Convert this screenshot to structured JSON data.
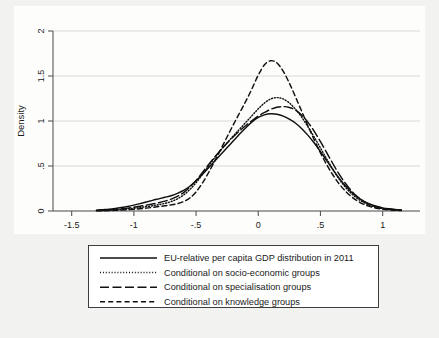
{
  "chart_data": {
    "type": "line",
    "title": "",
    "subtitle": "",
    "xlabel": "",
    "ylabel": "Density",
    "xlim": [
      -1.65,
      1.3
    ],
    "ylim": [
      0,
      2.12
    ],
    "grid": true,
    "grid_axis": "y",
    "legend_position": "below-plot",
    "xticks": [
      "-1.5",
      "-1",
      "-.5",
      "0",
      ".5",
      "1"
    ],
    "xtick_values": [
      -1.5,
      -1,
      -0.5,
      0,
      0.5,
      1
    ],
    "yticks": [
      "0",
      ".5",
      "1",
      "1.5",
      "2"
    ],
    "ytick_values": [
      0,
      0.5,
      1,
      1.5,
      2
    ],
    "x": [
      -1.3,
      -1.25,
      -1.2,
      -1.15,
      -1.1,
      -1.05,
      -1.0,
      -0.95,
      -0.9,
      -0.85,
      -0.8,
      -0.75,
      -0.7,
      -0.65,
      -0.6,
      -0.55,
      -0.5,
      -0.45,
      -0.4,
      -0.35,
      -0.3,
      -0.25,
      -0.2,
      -0.15,
      -0.1,
      -0.05,
      0.0,
      0.05,
      0.1,
      0.15,
      0.2,
      0.25,
      0.3,
      0.35,
      0.4,
      0.45,
      0.5,
      0.55,
      0.6,
      0.65,
      0.7,
      0.75,
      0.8,
      0.85,
      0.9,
      0.95,
      1.0,
      1.05,
      1.1,
      1.15
    ],
    "series": [
      {
        "name": "EU-relative per capita GDP distribution in 2011",
        "style": "solid",
        "peak_x": 0.04,
        "peak_y": 1.08,
        "values": [
          0.01,
          0.015,
          0.02,
          0.028,
          0.038,
          0.05,
          0.065,
          0.082,
          0.1,
          0.118,
          0.135,
          0.152,
          0.17,
          0.195,
          0.228,
          0.275,
          0.335,
          0.405,
          0.48,
          0.555,
          0.63,
          0.705,
          0.78,
          0.855,
          0.925,
          0.99,
          1.04,
          1.068,
          1.08,
          1.075,
          1.055,
          1.02,
          0.975,
          0.915,
          0.84,
          0.755,
          0.66,
          0.56,
          0.46,
          0.365,
          0.28,
          0.208,
          0.152,
          0.108,
          0.075,
          0.052,
          0.035,
          0.024,
          0.016,
          0.01
        ]
      },
      {
        "name": "Conditional on socio-economic groups",
        "style": "dotted",
        "peak_x": 0.06,
        "peak_y": 1.26,
        "values": [
          0.004,
          0.006,
          0.009,
          0.013,
          0.018,
          0.024,
          0.031,
          0.039,
          0.048,
          0.058,
          0.07,
          0.085,
          0.105,
          0.135,
          0.178,
          0.238,
          0.315,
          0.405,
          0.5,
          0.592,
          0.678,
          0.758,
          0.835,
          0.91,
          0.985,
          1.06,
          1.135,
          1.2,
          1.245,
          1.26,
          1.245,
          1.2,
          1.13,
          1.04,
          0.935,
          0.82,
          0.7,
          0.578,
          0.462,
          0.355,
          0.265,
          0.192,
          0.135,
          0.093,
          0.062,
          0.041,
          0.027,
          0.018,
          0.012,
          0.008
        ]
      },
      {
        "name": "Conditional on specialisation groups",
        "style": "longdash",
        "peak_x": 0.04,
        "peak_y": 1.16,
        "values": [
          0.006,
          0.009,
          0.013,
          0.018,
          0.024,
          0.032,
          0.042,
          0.053,
          0.065,
          0.078,
          0.092,
          0.11,
          0.132,
          0.162,
          0.205,
          0.265,
          0.34,
          0.425,
          0.515,
          0.6,
          0.68,
          0.755,
          0.825,
          0.89,
          0.95,
          1.005,
          1.055,
          1.095,
          1.13,
          1.152,
          1.16,
          1.15,
          1.12,
          1.065,
          0.985,
          0.885,
          0.77,
          0.648,
          0.525,
          0.41,
          0.308,
          0.222,
          0.155,
          0.105,
          0.069,
          0.045,
          0.029,
          0.019,
          0.012,
          0.008
        ]
      },
      {
        "name": "Conditional on knowledge groups",
        "style": "dash",
        "peak_x": 0.02,
        "peak_y": 1.67,
        "values": [
          0.002,
          0.003,
          0.005,
          0.007,
          0.01,
          0.014,
          0.019,
          0.025,
          0.032,
          0.04,
          0.049,
          0.058,
          0.068,
          0.082,
          0.105,
          0.145,
          0.212,
          0.308,
          0.425,
          0.555,
          0.69,
          0.825,
          0.96,
          1.09,
          1.22,
          1.36,
          1.51,
          1.625,
          1.67,
          1.645,
          1.555,
          1.42,
          1.265,
          1.105,
          0.945,
          0.79,
          0.645,
          0.515,
          0.4,
          0.302,
          0.222,
          0.158,
          0.109,
          0.073,
          0.048,
          0.031,
          0.02,
          0.013,
          0.008,
          0.005
        ]
      }
    ]
  },
  "axes": {
    "ylabel": "Density",
    "xticks": [
      {
        "label": "-1.5"
      },
      {
        "label": "-1"
      },
      {
        "label": "-.5"
      },
      {
        "label": "0"
      },
      {
        "label": ".5"
      },
      {
        "label": "1"
      }
    ],
    "yticks": [
      {
        "label": "0"
      },
      {
        "label": ".5"
      },
      {
        "label": "1"
      },
      {
        "label": "1.5"
      },
      {
        "label": "2"
      }
    ]
  },
  "legend": {
    "items": [
      {
        "label": "EU-relative per capita GDP distribution in 2011",
        "style": "solid"
      },
      {
        "label": "Conditional on socio-economic groups",
        "style": "dotted"
      },
      {
        "label": "Conditional on specialisation groups",
        "style": "longdash"
      },
      {
        "label": "Conditional on knowledge groups",
        "style": "dash"
      }
    ]
  },
  "colors": {
    "line": "#101010",
    "grid": "#c8c8c8",
    "axis": "#5a5a5a",
    "figure_background": "#f2f2f0",
    "plot_background": "#fdfdfc",
    "legend_background": "#ffffff",
    "legend_border": "#2a2a2a"
  }
}
